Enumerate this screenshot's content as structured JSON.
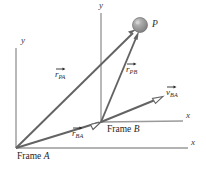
{
  "figure": {
    "background_color": "#ffffff",
    "axis_color": "#8c8c8c",
    "vector_color": "#5a5a5a",
    "text_color": "#2b2b2b",
    "sphere_color": "#9a9a9a"
  },
  "frames": {
    "a": {
      "name_prefix": "Frame",
      "name_suffix": "A",
      "x_axis_label": "x",
      "y_axis_label": "y",
      "origin": {
        "x": 16,
        "y": 148
      }
    },
    "b": {
      "name_prefix": "Frame",
      "name_suffix": "B",
      "x_axis_label": "x",
      "y_axis_label": "y",
      "origin": {
        "x": 101,
        "y": 122
      }
    }
  },
  "point": {
    "label": "P",
    "position": {
      "x": 141,
      "y": 26
    }
  },
  "vectors": [
    {
      "id": "r-pa",
      "symbol": "r",
      "subscript": "PA",
      "accent": "arrow",
      "description": "position of P relative to Frame A",
      "from": {
        "x": 16,
        "y": 148
      },
      "to": {
        "x": 136,
        "y": 30
      },
      "label_position": {
        "x": 55,
        "y": 73
      },
      "arrowhead": "solid"
    },
    {
      "id": "r-pb",
      "symbol": "r",
      "subscript": "PB",
      "accent": "arrow",
      "description": "position of P relative to Frame B",
      "from": {
        "x": 101,
        "y": 122
      },
      "to": {
        "x": 138,
        "y": 34
      },
      "label_position": {
        "x": 126,
        "y": 68
      },
      "arrowhead": "solid"
    },
    {
      "id": "r-ba",
      "symbol": "r",
      "subscript": "BA",
      "accent": "arrow",
      "description": "position of Frame B relative to Frame A",
      "from": {
        "x": 16,
        "y": 148
      },
      "to": {
        "x": 101,
        "y": 122
      },
      "label_position": {
        "x": 72,
        "y": 132
      },
      "arrowhead": "open"
    },
    {
      "id": "v-ba",
      "symbol": "v",
      "subscript": "BA",
      "accent": "arrow",
      "description": "velocity of Frame B relative to Frame A",
      "from": {
        "x": 101,
        "y": 122
      },
      "to": {
        "x": 163,
        "y": 97
      },
      "label_position": {
        "x": 166,
        "y": 91
      },
      "arrowhead": "open"
    }
  ],
  "axes": [
    {
      "id": "frame-a-y",
      "label": "y",
      "label_position": {
        "x": 22,
        "y": 41
      },
      "from": {
        "x": 16,
        "y": 148
      },
      "to": {
        "x": 16,
        "y": 48
      }
    },
    {
      "id": "frame-a-x",
      "label": "x",
      "label_position": {
        "x": 192,
        "y": 141
      },
      "from": {
        "x": 16,
        "y": 148
      },
      "to": {
        "x": 188,
        "y": 148
      }
    },
    {
      "id": "frame-b-y",
      "label": "y",
      "label_position": {
        "x": 101,
        "y": 4
      },
      "from": {
        "x": 101,
        "y": 122
      },
      "to": {
        "x": 101,
        "y": 13
      }
    },
    {
      "id": "frame-b-x",
      "label": "x",
      "label_position": {
        "x": 187,
        "y": 114
      },
      "from": {
        "x": 101,
        "y": 122
      },
      "to": {
        "x": 183,
        "y": 121
      }
    }
  ]
}
